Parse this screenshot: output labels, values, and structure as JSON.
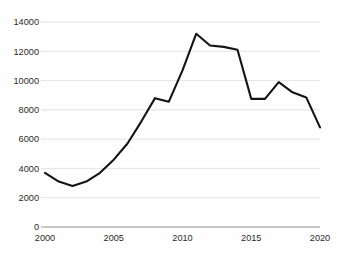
{
  "chart_data": {
    "type": "line",
    "title": "",
    "subtitle": "",
    "xlabel": "",
    "ylabel": "",
    "x": [
      2000,
      2001,
      2002,
      2003,
      2004,
      2005,
      2006,
      2007,
      2008,
      2009,
      2010,
      2011,
      2012,
      2013,
      2014,
      2015,
      2016,
      2017,
      2018,
      2019,
      2020
    ],
    "series": [
      {
        "name": "",
        "values": [
          3700,
          3100,
          2800,
          3100,
          3700,
          4600,
          5700,
          7200,
          8800,
          8550,
          10700,
          13200,
          12400,
          12300,
          12100,
          8750,
          8750,
          9900,
          9200,
          8850,
          6800
        ],
        "color": "#141414"
      }
    ],
    "xlim": [
      2000,
      2020
    ],
    "ylim": [
      0,
      14000
    ],
    "y_ticks": [
      0,
      2000,
      4000,
      6000,
      8000,
      10000,
      12000,
      14000
    ],
    "y_tick_labels": [
      "0",
      "2000",
      "4000",
      "6000",
      "8000",
      "10000",
      "12000",
      "14000"
    ],
    "x_ticks": [
      2000,
      2005,
      2010,
      2015,
      2020
    ],
    "x_tick_labels": [
      "2000",
      "2005",
      "2010",
      "2015",
      "2020"
    ],
    "grid": {
      "horizontal": true,
      "vertical": false,
      "color": "#d9d9d9"
    },
    "legend": {
      "visible": false,
      "position": "none",
      "entries": []
    },
    "axis": {
      "x_axis_line_color": "#8a8a8a",
      "y_axis_line_visible": false
    },
    "annotations": [],
    "background_color": "#fefefe"
  }
}
